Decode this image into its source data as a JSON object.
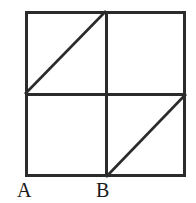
{
  "figure": {
    "kind": "geometry-diagram",
    "background_color": "#ffffff",
    "stroke_color": "#2b2b2b",
    "label_color": "#1a1a1a",
    "outer_square": {
      "left": 25,
      "top": 11,
      "right": 186,
      "bottom": 177,
      "stroke_width": 3
    },
    "midlines": {
      "vertical_x": 106,
      "horizontal_y": 94,
      "stroke_width": 3
    },
    "diagonals": [
      {
        "name": "upper-left-diagonal",
        "x1": 25,
        "y1": 94,
        "x2": 106,
        "y2": 11,
        "stroke_width": 2.6
      },
      {
        "name": "lower-right-diagonal",
        "x1": 106,
        "y1": 177,
        "x2": 186,
        "y2": 94,
        "stroke_width": 2.6
      }
    ],
    "labels": [
      {
        "id": "A",
        "text": "A",
        "x": 17,
        "y": 180
      },
      {
        "id": "B",
        "text": "B",
        "x": 96,
        "y": 180
      }
    ]
  }
}
